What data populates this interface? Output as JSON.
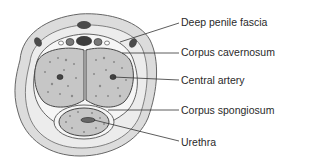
{
  "diagram": {
    "labels": [
      {
        "id": "deep-penile-fascia",
        "text": "Deep penile fascia",
        "y": 16
      },
      {
        "id": "corpus-cavernosum",
        "text": "Corpus cavernosum",
        "y": 46
      },
      {
        "id": "central-artery",
        "text": "Central artery",
        "y": 74
      },
      {
        "id": "corpus-spongiosum",
        "text": "Corpus spongiosum",
        "y": 104
      },
      {
        "id": "urethra",
        "text": "Urethra",
        "y": 136
      }
    ],
    "colors": {
      "outer_skin": "#d9d9d9",
      "tissue": "#c4c4c4",
      "vessel_dark": "#4a4a4a",
      "outline": "#555555",
      "leader_line": "#333333"
    }
  }
}
